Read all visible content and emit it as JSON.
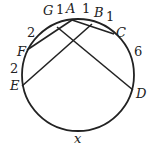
{
  "points": {
    "A": "A",
    "B": "B",
    "C": "C",
    "D": "D",
    "E": "E",
    "F": "F",
    "G": "G"
  },
  "arcs": {
    "GA": "1",
    "AB": "1",
    "BC": "1",
    "CD": "6",
    "FG": "2",
    "EF": "2",
    "DE": "x"
  }
}
